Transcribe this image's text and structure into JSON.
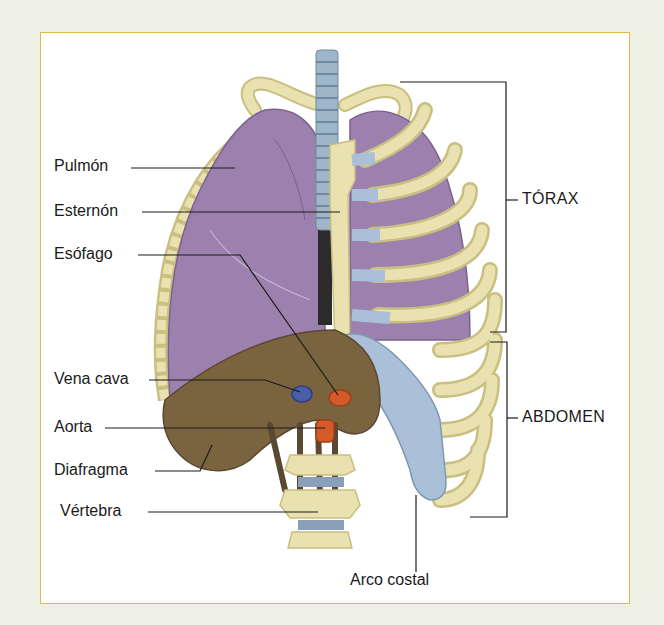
{
  "diagram": {
    "colors": {
      "background": "#eef0e4",
      "frame_border": "#e0b850",
      "lung": "#9c80ad",
      "lung_dark": "#7c6090",
      "bone": "#e9e2b0",
      "bone_shadow": "#c9bf80",
      "cartilage": "#a9c0d8",
      "diaphragm": "#7a6440",
      "diaphragm_dark": "#5a4830",
      "vena_cava": "#4a5ea8",
      "aorta": "#d55a2a",
      "trachea": "#9fb6c8",
      "leader_line": "#1a1a1a"
    },
    "left_labels": [
      {
        "id": "pulmon",
        "text": "Pulmón"
      },
      {
        "id": "esternon",
        "text": "Esternón"
      },
      {
        "id": "esofago",
        "text": "Esófago"
      },
      {
        "id": "vena_cava",
        "text": "Vena cava"
      },
      {
        "id": "aorta",
        "text": "Aorta"
      },
      {
        "id": "diafragma",
        "text": "Diafragma"
      },
      {
        "id": "vertebra",
        "text": "Vértebra"
      }
    ],
    "right_labels": [
      {
        "id": "torax",
        "text": "TÓRAX"
      },
      {
        "id": "abdomen",
        "text": "ABDOMEN"
      }
    ],
    "bottom_label": {
      "id": "arco_costal",
      "text": "Arco costal"
    }
  }
}
